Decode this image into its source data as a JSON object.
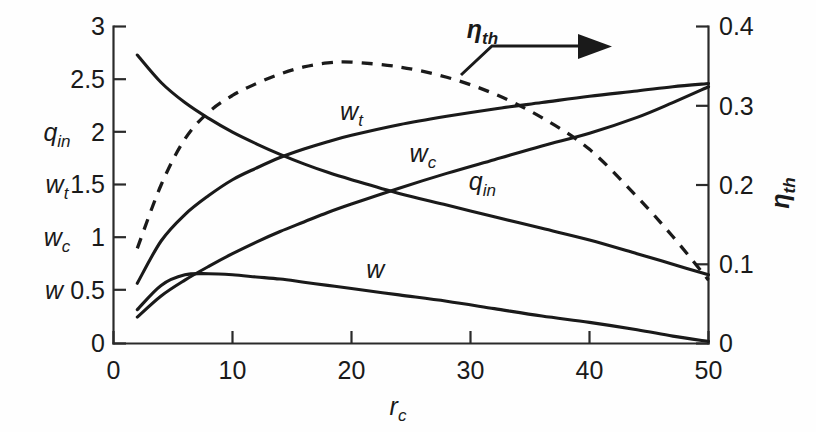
{
  "chart_data": {
    "type": "line",
    "title": "",
    "subtitle": "",
    "xlabel": "r_c",
    "xlabel_base": "r",
    "xlabel_sub": "c",
    "ylabel_left_stack": [
      "q_in",
      "w_t",
      "w_c",
      "w"
    ],
    "ylabel_right": "η_th",
    "ylabel_right_base": "η",
    "ylabel_right_sub": "th",
    "xlim": [
      0,
      50
    ],
    "ylim_left": [
      0,
      3
    ],
    "ylim_right": [
      0,
      0.4
    ],
    "xticks": [
      0,
      10,
      20,
      30,
      40,
      50
    ],
    "xtick_labels": [
      "0",
      "10",
      "20",
      "30",
      "40",
      "50"
    ],
    "yticks_left": [
      0,
      0.5,
      1,
      1.5,
      2,
      2.5,
      3
    ],
    "ytick_labels_left": [
      "0",
      "0.5",
      "1",
      "1.5",
      "2",
      "2.5",
      "3"
    ],
    "yticks_right": [
      0,
      0.1,
      0.2,
      0.3,
      0.4
    ],
    "ytick_labels_right": [
      "0",
      "0.1",
      "0.2",
      "0.3",
      "0.4"
    ],
    "grid": false,
    "legend": "inline-curve-labels",
    "x": [
      2,
      4,
      6,
      8,
      10,
      12,
      14,
      16,
      18,
      20,
      24,
      28,
      32,
      36,
      40,
      44,
      47,
      50
    ],
    "series": [
      {
        "name": "q_in",
        "label_base": "q",
        "label_sub": "in",
        "axis": "left",
        "style": "solid",
        "values": [
          2.73,
          2.47,
          2.28,
          2.13,
          2.0,
          1.89,
          1.79,
          1.7,
          1.62,
          1.55,
          1.42,
          1.31,
          1.2,
          1.09,
          0.98,
          0.85,
          0.75,
          0.65
        ],
        "label_x": 31,
        "label_y": 1.45
      },
      {
        "name": "w_t",
        "label_base": "w",
        "label_sub": "t",
        "axis": "left",
        "style": "solid",
        "values": [
          0.57,
          0.97,
          1.22,
          1.4,
          1.55,
          1.66,
          1.76,
          1.84,
          1.91,
          1.97,
          2.07,
          2.15,
          2.22,
          2.28,
          2.34,
          2.39,
          2.43,
          2.46
        ],
        "label_x": 20,
        "label_y": 2.12
      },
      {
        "name": "w_c",
        "label_base": "w",
        "label_sub": "c",
        "axis": "left",
        "style": "solid",
        "values": [
          0.25,
          0.45,
          0.6,
          0.73,
          0.85,
          0.96,
          1.06,
          1.15,
          1.24,
          1.32,
          1.47,
          1.61,
          1.74,
          1.87,
          1.99,
          2.14,
          2.28,
          2.43
        ],
        "label_x": 26,
        "label_y": 1.72
      },
      {
        "name": "w",
        "label_base": "w",
        "label_sub": "",
        "axis": "left",
        "style": "solid",
        "values": [
          0.32,
          0.55,
          0.65,
          0.66,
          0.65,
          0.63,
          0.61,
          0.58,
          0.55,
          0.52,
          0.46,
          0.4,
          0.33,
          0.26,
          0.2,
          0.13,
          0.07,
          0.02
        ],
        "label_x": 22,
        "label_y": 0.62
      },
      {
        "name": "eta_th",
        "label_base": "η",
        "label_sub": "th",
        "axis": "right",
        "style": "dashed",
        "values": [
          0.12,
          0.2,
          0.258,
          0.292,
          0.313,
          0.328,
          0.34,
          0.349,
          0.354,
          0.355,
          0.349,
          0.336,
          0.315,
          0.285,
          0.245,
          0.185,
          0.135,
          0.08
        ],
        "label_x": 31,
        "label_y": 0.385
      }
    ],
    "annotations": [
      {
        "name": "eta-th-arrow",
        "text": "η_th",
        "points_to": "right-axis",
        "direction": "right"
      }
    ],
    "colors": {
      "line": "#1a1a1a",
      "axis": "#2a2a2a",
      "background": "#fefefe"
    }
  }
}
